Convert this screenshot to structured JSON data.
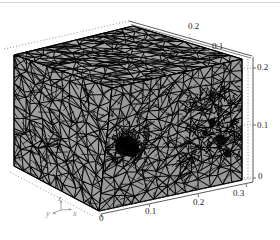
{
  "page": {
    "background": "#ffffff",
    "top_border_color": "#d6d6d6"
  },
  "chart_data": {
    "type": "mesh",
    "projection": "3d",
    "title": "",
    "x_axis": {
      "label": "x",
      "tick_labels": [
        "0",
        "0.1",
        "0.2",
        "0.3"
      ],
      "range": [
        0,
        0.3
      ]
    },
    "y_axis": {
      "label": "y",
      "tick_labels": [
        "0.2",
        "0.1"
      ],
      "range": [
        0,
        0.25
      ]
    },
    "z_axis": {
      "label": "z",
      "tick_labels": [
        "0.2",
        "0.1",
        "0"
      ],
      "range": [
        0,
        0.2
      ]
    },
    "triad": {
      "x": "x",
      "y": "y",
      "z": "z"
    },
    "grid": "dotted",
    "legend": "none",
    "mesh": {
      "element_type": "triangles",
      "face_color_top": "#a8a8a8",
      "face_color_left": "#9f9f9f",
      "face_color_right": "#989898",
      "edge_color": "#000000",
      "axis_line_color": "#4a4a4a",
      "grid_dot_color": "#777777",
      "refined_regions": [
        {
          "name": "embedded-sphere-blob",
          "cx": 127,
          "cy": 146,
          "rx": 12,
          "ry": 10
        },
        {
          "name": "right-face-dense-patch",
          "face": "right",
          "u_range": [
            0.58,
            0.99
          ],
          "v_range": [
            0.18,
            0.78
          ]
        },
        {
          "name": "blob-halo",
          "face": "right",
          "u_range": [
            0.04,
            0.3
          ],
          "v_range": [
            0.35,
            0.65
          ]
        }
      ],
      "micro_blobs": [
        {
          "cx": 221,
          "cy": 140,
          "r": 5
        },
        {
          "cx": 212,
          "cy": 122,
          "r": 3.5
        },
        {
          "cx": 228,
          "cy": 154,
          "r": 3.5
        },
        {
          "cx": 205,
          "cy": 133,
          "r": 3
        }
      ]
    }
  }
}
